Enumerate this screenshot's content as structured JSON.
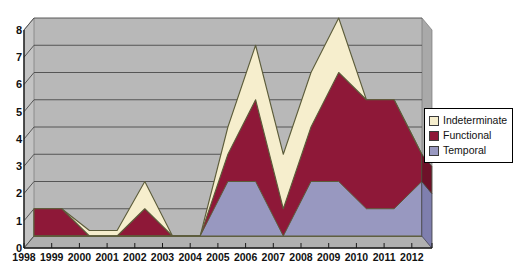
{
  "chart_data": {
    "type": "area",
    "stacked": true,
    "title": "",
    "xlabel": "",
    "ylabel": "",
    "ylim": [
      0,
      8
    ],
    "ytick_values": [
      0,
      1,
      2,
      3,
      4,
      5,
      6,
      7,
      8
    ],
    "grid": true,
    "legend_position": "right",
    "categories": [
      "1998",
      "1999",
      "2000",
      "2001",
      "2002",
      "2003",
      "2004",
      "2005",
      "2006",
      "2007",
      "2008",
      "2009",
      "2010",
      "2011",
      "2012"
    ],
    "series": [
      {
        "name": "Temporal",
        "color": "#9898c0",
        "values": [
          0,
          0,
          0,
          0,
          0,
          0,
          0,
          2,
          2,
          0,
          2,
          2,
          1,
          1,
          2
        ]
      },
      {
        "name": "Functional",
        "color": "#8e1838",
        "values": [
          1,
          1,
          0,
          0,
          1,
          0,
          0,
          1,
          3,
          1,
          2,
          4,
          4,
          4,
          1
        ]
      },
      {
        "name": "Indeterminate",
        "color": "#f6eecd",
        "values": [
          0,
          0,
          0.2,
          0.2,
          1,
          0,
          0,
          1,
          2,
          2,
          2,
          2,
          0,
          0,
          0
        ]
      }
    ],
    "totals": [
      1,
      1,
      0.2,
      0.2,
      2,
      0,
      0,
      4,
      7,
      3,
      6,
      8,
      5,
      5,
      3
    ]
  },
  "legend": {
    "items": [
      {
        "label": "Indeterminate",
        "color": "#f6eecd"
      },
      {
        "label": "Functional",
        "color": "#8e1838"
      },
      {
        "label": "Temporal",
        "color": "#9898c0"
      }
    ]
  },
  "axes": {
    "y_labels": [
      "8",
      "7",
      "6",
      "5",
      "4",
      "3",
      "2",
      "1",
      "0"
    ],
    "x_labels": [
      "1998",
      "1999",
      "2000",
      "2001",
      "2002",
      "2003",
      "2004",
      "2005",
      "2006",
      "2007",
      "2008",
      "2009",
      "2010",
      "2011",
      "2012"
    ]
  },
  "colors": {
    "plot_floor": "#b5b5b5",
    "plot_back": "#b8b8b8",
    "axis_line": "#1a1a1a",
    "grid_line": "#4a4a4a",
    "outline": "#5c5c3a"
  }
}
